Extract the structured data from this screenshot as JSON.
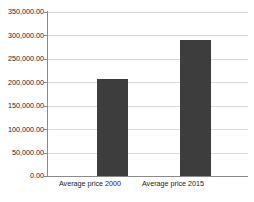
{
  "chart_data": {
    "type": "bar",
    "title": "",
    "xlabel": "",
    "ylabel": "",
    "categories": [
      "Average price 2000",
      "Average price 2015"
    ],
    "values": [
      207000,
      291000
    ],
    "series": [
      {
        "name": "Average price",
        "values": [
          207000,
          291000
        ]
      }
    ],
    "ylim": [
      0,
      350000
    ],
    "ytick_values": [
      0,
      50000,
      100000,
      150000,
      200000,
      250000,
      300000,
      350000
    ],
    "ytick_labels": [
      "0.00",
      "50,000.00",
      "100,000.00",
      "150,000.00",
      "200,000.00",
      "250,000.00",
      "300,000.00",
      "350,000.00"
    ],
    "grid": true,
    "legend": false,
    "legend_position": "none",
    "bar_color": "#3d3d3d",
    "gridline_color": "#d9d9d9",
    "axis_color": "#8a8a8a",
    "background_color": "#ffffff"
  }
}
